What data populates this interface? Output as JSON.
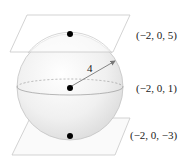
{
  "diagram": {
    "type": "sphere-between-tangent-planes",
    "sphere": {
      "center_label": "(−2, 0, 1)",
      "radius_label": "4"
    },
    "points": [
      {
        "name": "top",
        "label": "(−2, 0, 5)"
      },
      {
        "name": "center",
        "label": "(−2, 0, 1)"
      },
      {
        "name": "bottom",
        "label": "(−2, 0, −3)"
      }
    ],
    "planes": [
      {
        "name": "top-plane"
      },
      {
        "name": "bottom-plane"
      }
    ],
    "colors": {
      "plane_edge": "#c8c8c8",
      "sphere_fill": "#ebebeb",
      "sphere_edge": "#bdbdbd",
      "dot": "#000000",
      "arrow": "#777777",
      "text": "#222222"
    }
  }
}
